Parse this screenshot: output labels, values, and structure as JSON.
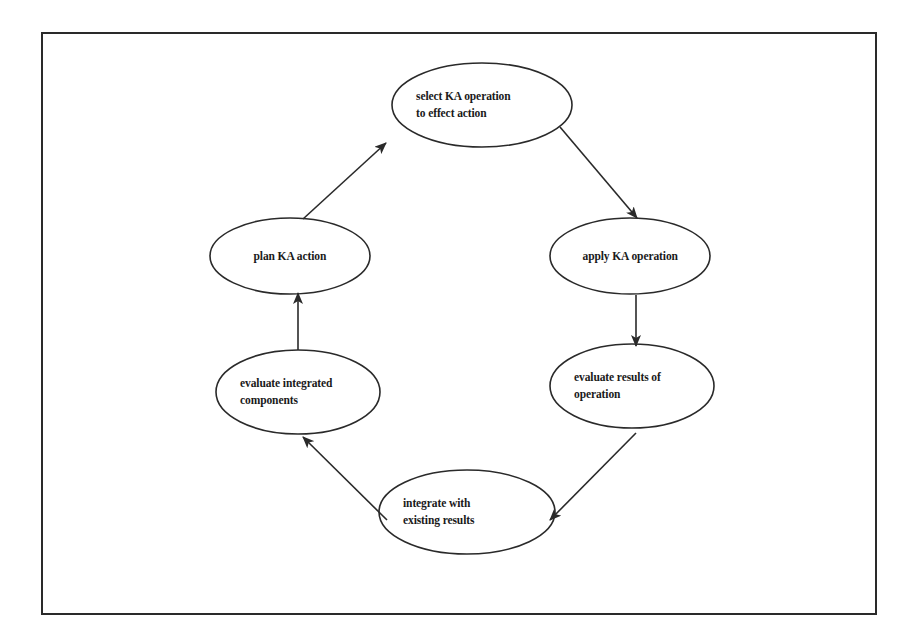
{
  "diagram": {
    "type": "cycle",
    "nodes": [
      {
        "id": "select",
        "lines": [
          "select KA operation",
          "to effect action"
        ],
        "cx": 482,
        "cy": 105,
        "rx": 90,
        "ry": 42
      },
      {
        "id": "apply",
        "lines": [
          "apply KA operation"
        ],
        "cx": 630,
        "cy": 256,
        "rx": 80,
        "ry": 38
      },
      {
        "id": "eval_results",
        "lines": [
          "evaluate results of",
          "operation"
        ],
        "cx": 632,
        "cy": 386,
        "rx": 82,
        "ry": 42
      },
      {
        "id": "integrate",
        "lines": [
          "integrate with",
          "existing results"
        ],
        "cx": 467,
        "cy": 512,
        "rx": 88,
        "ry": 42
      },
      {
        "id": "eval_integrated",
        "lines": [
          "evaluate integrated",
          "components"
        ],
        "cx": 298,
        "cy": 392,
        "rx": 82,
        "ry": 42
      },
      {
        "id": "plan",
        "lines": [
          "plan KA action"
        ],
        "cx": 290,
        "cy": 256,
        "rx": 80,
        "ry": 38
      }
    ],
    "edges": [
      {
        "from": "select",
        "to": "apply",
        "x1": 560,
        "y1": 127,
        "x2": 637,
        "y2": 218
      },
      {
        "from": "apply",
        "to": "eval_results",
        "x1": 636,
        "y1": 295,
        "x2": 636,
        "y2": 346
      },
      {
        "from": "eval_results",
        "to": "integrate",
        "x1": 636,
        "y1": 433,
        "x2": 550,
        "y2": 520
      },
      {
        "from": "integrate",
        "to": "eval_integrated",
        "x1": 387,
        "y1": 520,
        "x2": 303,
        "y2": 437
      },
      {
        "from": "eval_integrated",
        "to": "plan",
        "x1": 298,
        "y1": 350,
        "x2": 298,
        "y2": 293
      },
      {
        "from": "plan",
        "to": "select",
        "x1": 303,
        "y1": 219,
        "x2": 386,
        "y2": 143
      }
    ],
    "colors": {
      "line": "#2a2a2a",
      "text": "#1a1a1a",
      "background": "#ffffff"
    }
  }
}
